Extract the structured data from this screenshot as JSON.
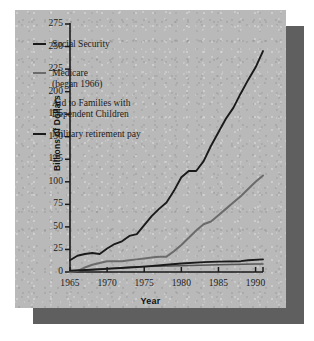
{
  "chart_data": {
    "type": "line",
    "title": "",
    "xlabel": "Year",
    "ylabel": "Billions of Dollars",
    "xlim": [
      1965,
      1991
    ],
    "ylim": [
      0,
      275
    ],
    "xticks": [
      1965,
      1970,
      1975,
      1980,
      1985,
      1990
    ],
    "yticks": [
      0,
      25,
      50,
      75,
      100,
      125,
      150,
      175,
      200,
      225,
      250,
      275
    ],
    "grid": false,
    "legend_position": "upper-left-inside",
    "series": [
      {
        "name": "Social Security",
        "color": "#1a1a1a",
        "x": [
          1965,
          1966,
          1967,
          1968,
          1969,
          1970,
          1971,
          1972,
          1973,
          1974,
          1975,
          1976,
          1977,
          1978,
          1979,
          1980,
          1981,
          1982,
          1983,
          1984,
          1985,
          1986,
          1987,
          1988,
          1989,
          1990,
          1991
        ],
        "values": [
          13,
          18,
          20,
          21,
          20,
          26,
          31,
          34,
          40,
          42,
          52,
          62,
          70,
          77,
          90,
          105,
          112,
          112,
          123,
          140,
          155,
          170,
          182,
          198,
          213,
          227,
          245
        ]
      },
      {
        "name": "Medicare (began 1966)",
        "color": "#6b6b6b",
        "x": [
          1965,
          1966,
          1967,
          1968,
          1969,
          1970,
          1971,
          1972,
          1973,
          1974,
          1975,
          1976,
          1977,
          1978,
          1979,
          1980,
          1981,
          1982,
          1983,
          1984,
          1985,
          1986,
          1987,
          1988,
          1989,
          1990,
          1991
        ],
        "values": [
          0,
          1,
          5,
          8,
          10,
          12,
          12,
          12,
          13,
          14,
          15,
          16,
          17,
          17,
          23,
          30,
          38,
          46,
          53,
          56,
          63,
          70,
          77,
          84,
          92,
          100,
          107
        ]
      },
      {
        "name": "Aid to Families with Dependent Children",
        "color": "#555555",
        "x": [
          1965,
          1970,
          1975,
          1980,
          1985,
          1990,
          1991
        ],
        "values": [
          1,
          4,
          6,
          7,
          8,
          9,
          9
        ]
      },
      {
        "name": "Military retirement pay",
        "color": "#1a1a1a",
        "x": [
          1965,
          1968,
          1970,
          1973,
          1975,
          1978,
          1980,
          1983,
          1985,
          1988,
          1989,
          1991
        ],
        "values": [
          1.5,
          2.5,
          3.5,
          5,
          6,
          8,
          9.5,
          11,
          11.5,
          12,
          13,
          14
        ]
      }
    ],
    "legend": [
      {
        "label": "Social Security",
        "swatch": true,
        "color": "#1a1a1a"
      },
      {
        "label": "Medicare",
        "label2": "(began 1966)",
        "swatch": true,
        "color": "#6b6b6b"
      },
      {
        "label": "Aid to Families with",
        "label2": "Dependent Children",
        "swatch": false,
        "color": "#555555"
      },
      {
        "label": "Military retirement pay",
        "swatch": true,
        "color": "#1a1a1a"
      }
    ]
  },
  "colors": {
    "panel_bg": "#b9b9b9",
    "shadow": "#5f5f5f",
    "axis": "#1a1a1a",
    "page_bg": "#ffffff"
  }
}
